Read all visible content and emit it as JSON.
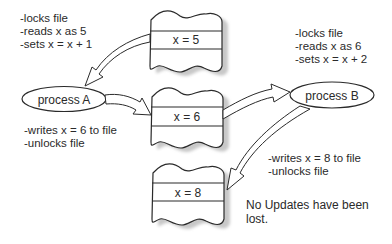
{
  "diagram": {
    "processes": [
      {
        "id": "A",
        "label": "process A"
      },
      {
        "id": "B",
        "label": "process B"
      }
    ],
    "file_states": [
      {
        "label": "x = 5"
      },
      {
        "label": "x = 6"
      },
      {
        "label": "x = 8"
      }
    ],
    "notes": {
      "process_a_read": [
        "-locks file",
        "-reads x as 5",
        "-sets x = x + 1"
      ],
      "process_a_write": [
        "-writes x = 6 to file",
        "-unlocks file"
      ],
      "process_b_read": [
        "-locks file",
        "-reads x as 6",
        "-sets x = x + 2"
      ],
      "process_b_write": [
        "-writes x = 8 to file",
        "-unlocks file"
      ],
      "conclusion": [
        "No Updates have been",
        "lost."
      ]
    },
    "colors": {
      "stroke": "#2a2a2a",
      "shadow": "#c8c8c8",
      "background": "#ffffff"
    }
  }
}
